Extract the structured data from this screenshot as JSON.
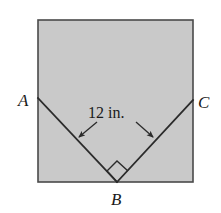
{
  "figure": {
    "background_color": "#ffffff",
    "square": {
      "fill_color": "#c9c9c9",
      "stroke_color": "#4a4a4a",
      "stroke_width": 1.6,
      "left": 38,
      "top": 20,
      "right": 193,
      "bottom": 182
    },
    "lines": {
      "stroke_color": "#2b2b2b",
      "stroke_width": 1.8,
      "segment_ab": {
        "x1": 38,
        "y1": 98,
        "x2": 117,
        "y2": 182
      },
      "segment_bc": {
        "x1": 117,
        "y1": 182,
        "x2": 193,
        "y2": 100
      }
    },
    "right_angle_marker": {
      "stroke_color": "#2b2b2b",
      "stroke_width": 1.4,
      "points": "117,182 107,171 117,161 128,171"
    },
    "labels": {
      "a": {
        "text": "A",
        "x": 18,
        "y": 106
      },
      "b": {
        "text": "B",
        "x": 111,
        "y": 205
      },
      "c": {
        "text": "C",
        "x": 198,
        "y": 108
      }
    },
    "measurement": {
      "text": "12 in.",
      "x": 88,
      "y": 118,
      "arrow_color": "#2b2b2b",
      "arrow_width": 1.3,
      "left_arrow": {
        "x1": 97,
        "y1": 122,
        "x2": 79,
        "y2": 137
      },
      "right_arrow": {
        "x1": 136,
        "y1": 122,
        "x2": 153,
        "y2": 137
      }
    }
  }
}
